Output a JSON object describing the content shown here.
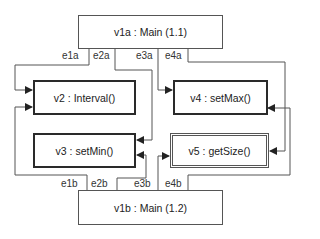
{
  "diagram": {
    "nodes": {
      "v1a": {
        "label": "v1a : Main (1.1)",
        "style": "plain"
      },
      "v2": {
        "label": "v2 : Interval()",
        "style": "thick"
      },
      "v3": {
        "label": "v3 : setMin()",
        "style": "thick"
      },
      "v4": {
        "label": "v4 : setMax()",
        "style": "thick"
      },
      "v5": {
        "label": "v5 : getSize()",
        "style": "double"
      },
      "v1b": {
        "label": "v1b : Main (1.2)",
        "style": "plain"
      }
    },
    "edges": {
      "e1a": {
        "label": "e1a",
        "from": "v1a",
        "to": "v2"
      },
      "e2a": {
        "label": "e2a",
        "from": "v1a",
        "to": "v3"
      },
      "e3a": {
        "label": "e3a",
        "from": "v1a",
        "to": "v4"
      },
      "e4a": {
        "label": "e4a",
        "from": "v1a",
        "to": "v5"
      },
      "e1b": {
        "label": "e1b",
        "from": "v1b",
        "to": "v2"
      },
      "e2b": {
        "label": "e2b",
        "from": "v1b",
        "to": "v3"
      },
      "e3b": {
        "label": "e3b",
        "from": "v1b",
        "to": "v5"
      },
      "e4b": {
        "label": "e4b",
        "from": "v1b",
        "to": "v4"
      }
    },
    "colors": {
      "line": "#555555",
      "thick_border": "#2a2a2a",
      "arrow": "#222222"
    }
  }
}
